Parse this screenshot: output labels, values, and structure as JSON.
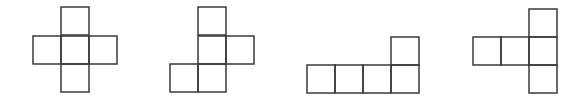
{
  "diagram": {
    "title": "",
    "stroke_color": "#3a3a3a",
    "background": "#ffffff",
    "square_size": 28,
    "nets": [
      {
        "name": "cross-net",
        "squares": [
          [
            61,
            7
          ],
          [
            33,
            36
          ],
          [
            61,
            36
          ],
          [
            89,
            36
          ],
          [
            61,
            64
          ]
        ]
      },
      {
        "name": "zigzag-net",
        "squares": [
          [
            198,
            7
          ],
          [
            198,
            36
          ],
          [
            226,
            36
          ],
          [
            170,
            64
          ],
          [
            198,
            64
          ]
        ]
      },
      {
        "name": "l-net",
        "squares": [
          [
            391,
            37
          ],
          [
            307,
            65
          ],
          [
            335,
            65
          ],
          [
            363,
            65
          ],
          [
            391,
            65
          ]
        ]
      },
      {
        "name": "t-net",
        "squares": [
          [
            529,
            9
          ],
          [
            473,
            37
          ],
          [
            501,
            37
          ],
          [
            529,
            37
          ],
          [
            529,
            65
          ]
        ]
      }
    ]
  }
}
